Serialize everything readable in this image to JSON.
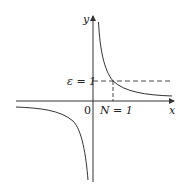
{
  "diagram": {
    "type": "function-graph",
    "function": "y = 1/x",
    "axes": {
      "x_label": "x",
      "y_label": "y",
      "origin_label": "0"
    },
    "annotations": {
      "epsilon_label": "ε = 1",
      "n_label": "N = 1",
      "n_tick_label": "1"
    },
    "colors": {
      "curve": "#333333",
      "axis": "#333333",
      "dashed": "#333333"
    }
  }
}
